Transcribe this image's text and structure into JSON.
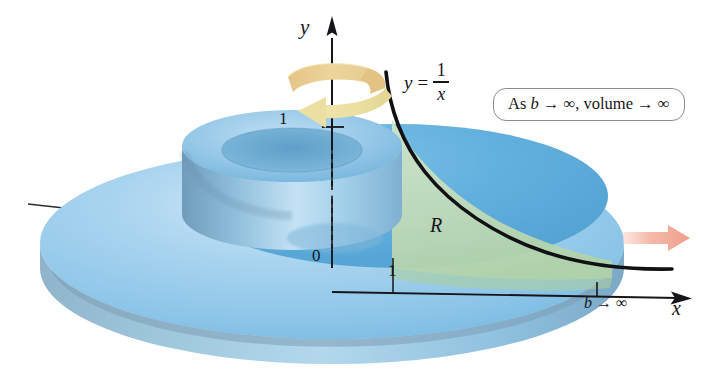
{
  "figure": {
    "axes": {
      "y_axis_label": "y",
      "x_axis_label": "x",
      "y_tick_label": "1",
      "origin_label": "0",
      "x_tick_label": "1",
      "x_limit_label": "b → ∞",
      "x_limit_b": "b",
      "x_limit_rest": " → ∞"
    },
    "curve": {
      "equation_lhs": "y",
      "equation_equals": "=",
      "equation_numerator": "1",
      "equation_denominator": "x"
    },
    "region": {
      "label": "R"
    },
    "callout": {
      "prefix": "As ",
      "variable": "b",
      "text": " → ∞, volume → ∞",
      "full_text": "As b → ∞, volume → ∞"
    },
    "colors": {
      "solid_light_blue": "#a8d4ef",
      "solid_mid_blue": "#67b3dd",
      "solid_deep_blue": "#4e9fd0",
      "solid_rim_shadow": "#7d9cb4",
      "solid_top_highlight": "#c9e4f5",
      "region_green": "#c8dfc0",
      "region_green_dark": "#aacfa0",
      "rotation_arrow_tan": "#e8c98a",
      "rotation_arrow_pale": "#efe0a8",
      "motion_arrow_pink": "#f0a795",
      "axis_black": "#16161a",
      "callout_border": "#8d8d92",
      "background": "#ffffff"
    }
  }
}
